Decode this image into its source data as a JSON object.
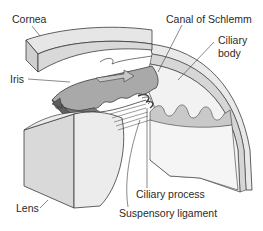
{
  "diagram": {
    "labels": {
      "cornea": "Cornea",
      "canal_of_schlemm": "Canal of Schlemm",
      "ciliary_body_line1": "Ciliary",
      "ciliary_body_line2": "body",
      "iris": "Iris",
      "lens": "Lens",
      "ciliary_process": "Ciliary process",
      "suspensory_ligament": "Suspensory ligament"
    },
    "colors": {
      "background": "#ffffff",
      "outline": "#3a3a3a",
      "cornea_top": "#e6e6e6",
      "cornea_side": "#d2d2d2",
      "iris": "#a9a9a9",
      "iris_dark": "#6e6e6e",
      "lens_front": "#d9d9d9",
      "lens_side": "#ececec",
      "sclera": "#e9e9e9",
      "ciliary": "#c4c4c4",
      "label_text": "#2a2a2a"
    }
  }
}
